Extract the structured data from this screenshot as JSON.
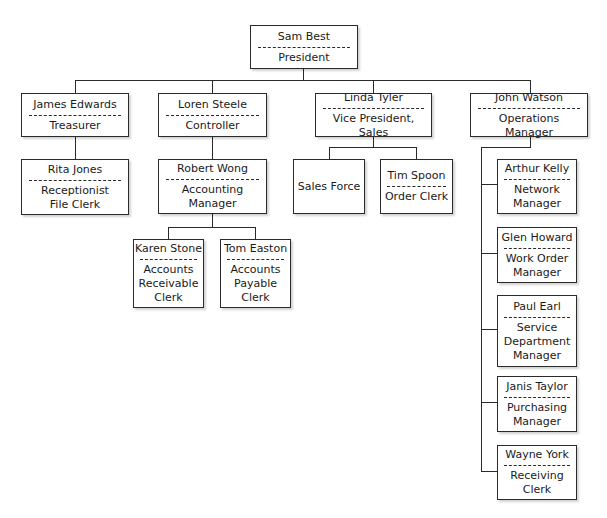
{
  "org_chart": {
    "president": {
      "name": "Sam Best",
      "title": "President"
    },
    "treasurer": {
      "name": "James Edwards",
      "title": "Treasurer"
    },
    "controller": {
      "name": "Loren Steele",
      "title": "Controller"
    },
    "vp_sales": {
      "name": "Linda Tyler",
      "title": "Vice President, Sales"
    },
    "ops_manager": {
      "name": "John Watson",
      "title": "Operations Manager"
    },
    "receptionist": {
      "name": "Rita Jones",
      "title": "Receptionist\nFile Clerk"
    },
    "accounting_manager": {
      "name": "Robert Wong",
      "title": "Accounting\nManager"
    },
    "ar_clerk": {
      "name": "Karen Stone",
      "title": "Accounts\nReceivable\nClerk"
    },
    "ap_clerk": {
      "name": "Tom Easton",
      "title": "Accounts\nPayable\nClerk"
    },
    "sales_force": {
      "name": "Sales Force"
    },
    "order_clerk": {
      "name": "Tim Spoon",
      "title": "Order Clerk"
    },
    "network_manager": {
      "name": "Arthur Kelly",
      "title": "Network\nManager"
    },
    "work_order_manager": {
      "name": "Glen Howard",
      "title": "Work Order\nManager"
    },
    "service_manager": {
      "name": "Paul Earl",
      "title": "Service\nDepartment\nManager"
    },
    "purchasing_manager": {
      "name": "Janis Taylor",
      "title": "Purchasing\nManager"
    },
    "receiving_clerk": {
      "name": "Wayne York",
      "title": "Receiving\nClerk"
    }
  }
}
